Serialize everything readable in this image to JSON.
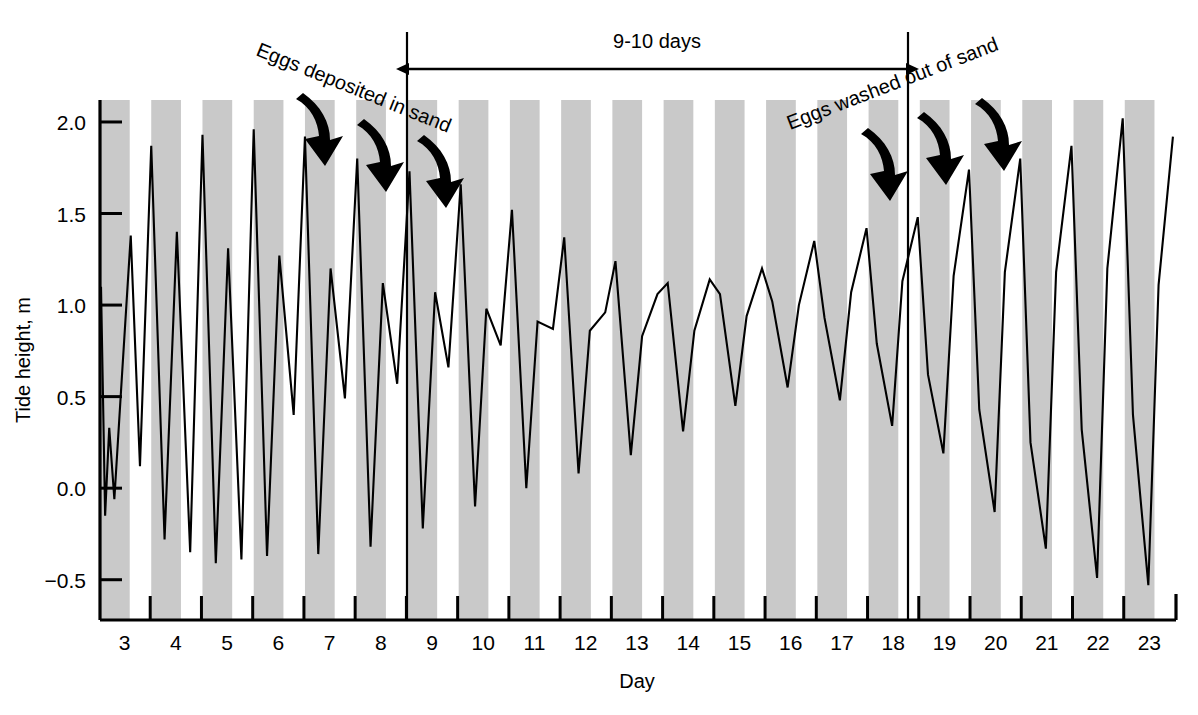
{
  "chart_data": {
    "type": "line",
    "title": "",
    "xlabel": "Day",
    "ylabel": "Tide height, m",
    "xlim": [
      2.52,
      23.52
    ],
    "ylim": [
      -0.72,
      2.12
    ],
    "grid": false,
    "legend": "none",
    "yticks": [
      -0.5,
      0.0,
      0.5,
      1.0,
      1.5,
      2.0
    ],
    "ytick_labels": [
      "−0.5",
      "0.0",
      "0.5",
      "1.0",
      "1.5",
      "2.0"
    ],
    "xticks": [
      3.5,
      4.5,
      5.5,
      6.5,
      7.5,
      8.5,
      9.5,
      10.5,
      11.5,
      12.5,
      13.5,
      14.5,
      15.5,
      16.5,
      17.5,
      18.5,
      19.5,
      20.5,
      21.5,
      22.5
    ],
    "xtick_labels": [
      "3",
      "4",
      "5",
      "6",
      "7",
      "8",
      "9",
      "10",
      "11",
      "12",
      "13",
      "14",
      "15",
      "16",
      "17",
      "18",
      "19",
      "20",
      "21",
      "22",
      "23"
    ],
    "xtick_label_positions": [
      3,
      4,
      5,
      6,
      7,
      8,
      9,
      10,
      11,
      12,
      13,
      14,
      15,
      16,
      17,
      18,
      19,
      20,
      21,
      22,
      23
    ],
    "series": [
      {
        "name": "Tide height",
        "color": "#000000",
        "x": [
          2.54,
          2.62,
          2.7,
          2.8,
          2.95,
          3.12,
          3.3,
          3.52,
          3.78,
          4.02,
          4.28,
          4.52,
          4.78,
          5.02,
          5.28,
          5.52,
          5.78,
          6.02,
          6.3,
          6.52,
          6.78,
          7.02,
          7.3,
          7.54,
          7.8,
          8.04,
          8.32,
          8.56,
          8.82,
          9.06,
          9.32,
          9.56,
          9.84,
          10.06,
          10.34,
          10.56,
          10.84,
          11.06,
          11.36,
          11.58,
          11.86,
          12.08,
          12.38,
          12.58,
          12.88,
          13.1,
          13.4,
          13.6,
          13.9,
          14.12,
          14.42,
          14.62,
          14.92,
          15.14,
          15.44,
          15.64,
          15.94,
          16.16,
          16.46,
          16.66,
          16.96,
          17.18,
          17.48,
          17.68,
          17.98,
          18.18,
          18.48,
          18.68,
          18.98,
          19.18,
          19.48,
          19.68,
          19.98,
          20.18,
          20.48,
          20.68,
          20.98,
          21.18,
          21.48,
          21.68,
          21.98,
          22.18,
          22.48,
          22.68,
          22.98,
          23.18,
          23.46
        ],
        "y": [
          1.1,
          -0.15,
          0.33,
          -0.06,
          0.62,
          1.38,
          0.12,
          1.87,
          -0.28,
          1.4,
          -0.35,
          1.93,
          -0.41,
          1.31,
          -0.39,
          1.96,
          -0.37,
          1.27,
          0.4,
          1.92,
          -0.36,
          1.2,
          0.49,
          1.8,
          -0.32,
          1.12,
          0.57,
          1.73,
          -0.22,
          1.07,
          0.66,
          1.66,
          -0.1,
          0.98,
          0.78,
          1.52,
          0.0,
          0.91,
          0.87,
          1.37,
          0.08,
          0.86,
          0.96,
          1.24,
          0.18,
          0.83,
          1.06,
          1.12,
          0.31,
          0.86,
          1.14,
          1.06,
          0.45,
          0.94,
          1.2,
          1.02,
          0.55,
          1.0,
          1.35,
          0.93,
          0.48,
          1.07,
          1.42,
          0.79,
          0.34,
          1.13,
          1.48,
          0.62,
          0.19,
          1.16,
          1.74,
          0.43,
          -0.13,
          1.18,
          1.8,
          0.25,
          -0.33,
          1.18,
          1.87,
          0.32,
          -0.49,
          1.2,
          2.02,
          0.4,
          -0.53,
          1.11,
          1.92
        ]
      }
    ],
    "shaded_bands": {
      "description": "alternating gray vertical bands marking night periods",
      "color": "#c9c9c9",
      "band_start_offset": 0.0,
      "band_width_days": 0.58,
      "band_period_days": 1.0,
      "first_band_start": 2.52
    }
  },
  "axis": {
    "y_label": "Tide height, m",
    "x_label": "Day"
  },
  "annotations": {
    "span": {
      "label": "9-10 days",
      "start_day": 8.62,
      "end_day": 18.62
    },
    "left_note": {
      "label": "Eggs deposited in sand",
      "arrows": 3
    },
    "right_note": {
      "label": "Eggs washed out of sand",
      "arrows": 3
    }
  }
}
